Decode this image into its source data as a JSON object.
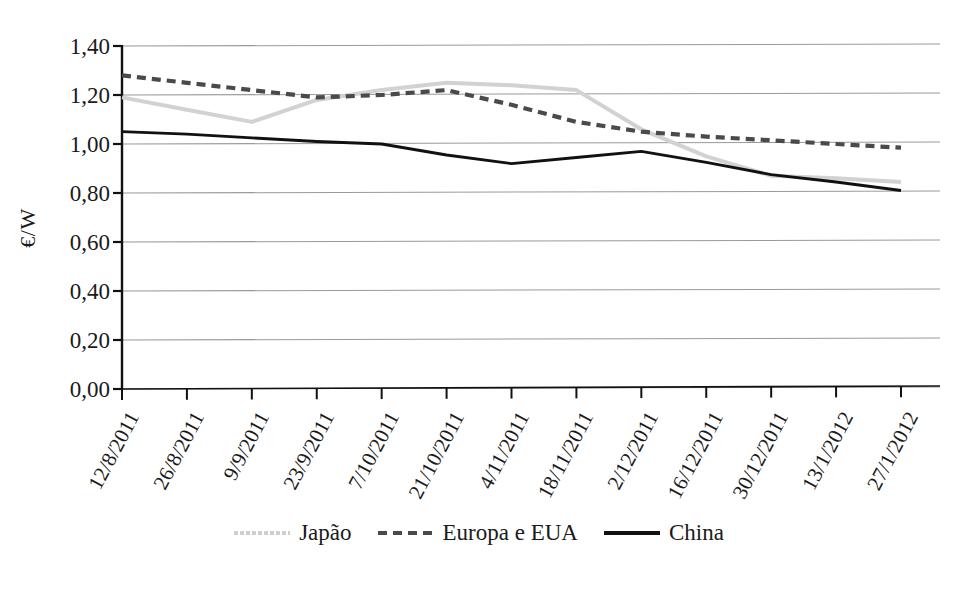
{
  "chart_data": {
    "type": "line",
    "title": "",
    "subtitle": "",
    "xlabel": "",
    "ylabel": "€/W",
    "ylim": [
      0.0,
      1.4
    ],
    "ytick_labels": [
      "0,00",
      "0,20",
      "0,40",
      "0,60",
      "0,80",
      "1,00",
      "1,20",
      "1,40"
    ],
    "ytick_values": [
      0.0,
      0.2,
      0.4,
      0.6,
      0.8,
      1.0,
      1.2,
      1.4
    ],
    "grid": "horizontal",
    "legend_position": "bottom",
    "categories": [
      "12/8/2011",
      "26/8/2011",
      "9/9/2011",
      "23/9/2011",
      "7/10/2011",
      "21/10/2011",
      "4/11/2011",
      "18/11/2011",
      "2/12/2011",
      "16/12/2011",
      "30/12/2011",
      "13/1/2012",
      "27/1/2012"
    ],
    "series": [
      {
        "name": "Japão",
        "color": "#d2d2d2",
        "style": "solid-light",
        "values": [
          1.19,
          1.14,
          1.09,
          1.18,
          1.22,
          1.25,
          1.24,
          1.22,
          1.06,
          0.95,
          0.87,
          0.86,
          0.845
        ]
      },
      {
        "name": "Europa e EUA",
        "color": "#4a4a4a",
        "style": "dashed",
        "values": [
          1.28,
          1.25,
          1.22,
          1.19,
          1.2,
          1.22,
          1.16,
          1.09,
          1.05,
          1.03,
          1.015,
          1.0,
          0.985
        ]
      },
      {
        "name": "China",
        "color": "#111111",
        "style": "solid",
        "values": [
          1.05,
          1.04,
          1.025,
          1.01,
          1.0,
          0.955,
          0.92,
          0.945,
          0.97,
          0.925,
          0.875,
          0.845,
          0.81
        ]
      }
    ]
  },
  "axis": {
    "y_label_text": "€/W"
  },
  "legend": {
    "items": [
      {
        "label": "Japão"
      },
      {
        "label": "Europa e EUA"
      },
      {
        "label": "China"
      }
    ]
  },
  "colors": {
    "japao": "#d2d2d2",
    "europa": "#4a4a4a",
    "china": "#111111",
    "grid": "#9a9a9a",
    "axis": "#111111",
    "background": "#ffffff"
  }
}
